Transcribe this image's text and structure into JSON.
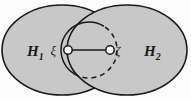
{
  "figure": {
    "kind": "venn-diagram",
    "caption": "",
    "width": 191,
    "height": 100,
    "background_color": "#fdfdfd",
    "fill_color": "#c8c8c8",
    "stroke_color": "#1a1a1a",
    "node_fill_color": "#ffffff"
  },
  "regions": [
    {
      "id": "left-ellipse",
      "label_base": "H",
      "label_sub": "1",
      "label_text": "H₁",
      "cx": 62,
      "cy": 50,
      "rx": 60,
      "ry": 45,
      "label_x": 27,
      "label_y": 56
    },
    {
      "id": "right-ellipse",
      "label_base": "H",
      "label_sub": "2",
      "label_text": "H₂",
      "cx": 127,
      "cy": 50,
      "rx": 60,
      "ry": 45,
      "label_x": 144,
      "label_y": 56
    }
  ],
  "circle": {
    "id": "middle-circle",
    "cx": 89,
    "cy": 50,
    "r": 28,
    "solid_style": "solid",
    "dashed_style": "dashed",
    "dash_pattern": "5,4"
  },
  "nodes": [
    {
      "id": "node-xi",
      "label": "ξ",
      "cx": 68,
      "cy": 50,
      "r": 4.2,
      "label_x": 56,
      "label_y": 55
    },
    {
      "id": "node-zeta",
      "label": "ζ",
      "cx": 110,
      "cy": 50,
      "r": 4.2,
      "label_x": 115,
      "label_y": 55
    }
  ],
  "edge": {
    "id": "segment-xi-zeta",
    "x1": 68,
    "y1": 50,
    "x2": 110,
    "y2": 50
  }
}
